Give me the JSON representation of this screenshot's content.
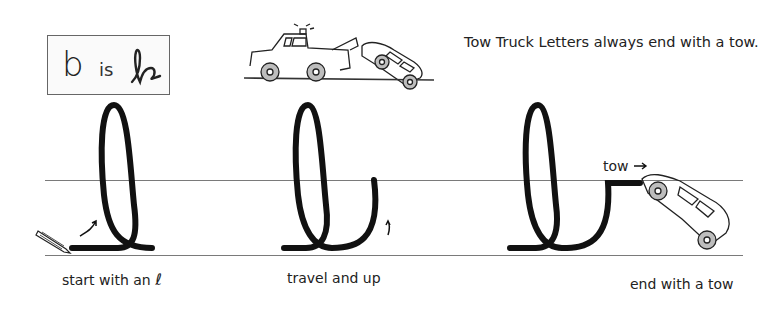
{
  "rule_box": {
    "print_letter": "b",
    "connector": "is",
    "cursive_letter_name": "cursive b"
  },
  "headline": "Tow Truck Letters always end with a tow.",
  "steps": [
    {
      "caption": "start with an",
      "caption_glyph": "ℓ",
      "illustration": "cursive l loop with pencil and arrow"
    },
    {
      "caption": "travel and up",
      "illustration": "cursive l loop traveling and up with arrow"
    },
    {
      "caption": "end with a tow",
      "tow_label": "tow",
      "illustration": "cursive b ending with tow line to car"
    }
  ],
  "icons": [
    "tow-truck-illustration",
    "pencil-icon",
    "stroke-arrow-icon",
    "towed-car-illustration",
    "right-arrow-icon"
  ],
  "colors": {
    "stroke": "#111111",
    "guide": "#7a7a7a",
    "box_border": "#666666",
    "wheel": "#bdbdbd"
  }
}
